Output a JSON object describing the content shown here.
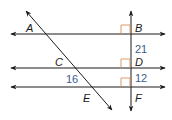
{
  "diagram": {
    "type": "parallel-lines-transversal",
    "colors": {
      "line": "#1a1a1a",
      "right_angle_marker": "#d9905a",
      "measure_text": "#3d5a8c",
      "point_text": "#1a1a1a"
    },
    "points": [
      {
        "id": "A",
        "label": "A",
        "x": 30,
        "y": 32
      },
      {
        "id": "B",
        "label": "B",
        "x": 135,
        "y": 32
      },
      {
        "id": "C",
        "label": "C",
        "x": 56,
        "y": 66
      },
      {
        "id": "D",
        "label": "D",
        "x": 135,
        "y": 66
      },
      {
        "id": "E",
        "label": "E",
        "x": 83,
        "y": 101
      },
      {
        "id": "F",
        "label": "F",
        "x": 135,
        "y": 101
      }
    ],
    "measures": [
      {
        "id": "m21",
        "label": "21",
        "segment": "BD",
        "x": 135,
        "y": 52
      },
      {
        "id": "m12",
        "label": "12",
        "segment": "DF",
        "x": 135,
        "y": 82
      },
      {
        "id": "m16",
        "label": "16",
        "segment": "CE",
        "x": 66,
        "y": 82
      }
    ]
  }
}
